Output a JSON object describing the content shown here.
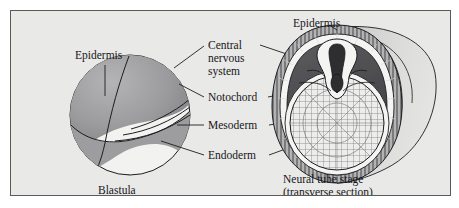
{
  "figure": {
    "panel_background": "#e9e9e7",
    "border_color": "#5a5a58",
    "ink_color": "#16161a"
  },
  "labels": {
    "epidermis_left": "Epidermis",
    "epidermis_right": "Epidermis",
    "cns_line1": "Central",
    "cns_line2": "nervous",
    "cns_line3": "system",
    "notochord": "Notochord",
    "mesoderm": "Mesoderm",
    "endoderm": "Endoderm"
  },
  "captions": {
    "left_stage": "Blastula",
    "right_stage_line1": "Neural tube stage",
    "right_stage_line2": "(transverse section)"
  },
  "diagrams": {
    "blastula": {
      "name": "Blastula",
      "description": "Sphere with shaded gray gastrulating region over white lower portion"
    },
    "neural_tube": {
      "name": "Neural tube stage (transverse section)",
      "layers": [
        "epidermis",
        "central nervous system",
        "notochord",
        "mesoderm",
        "endoderm"
      ]
    }
  },
  "colors": {
    "shade_dark": "#8e8e90",
    "shade_mid": "#a4a4a6",
    "shade_light": "#c4c4c5",
    "ring_dark": "#4d4d50",
    "ring_hatch": "#9a9a9c",
    "white": "#f4f4f2"
  }
}
